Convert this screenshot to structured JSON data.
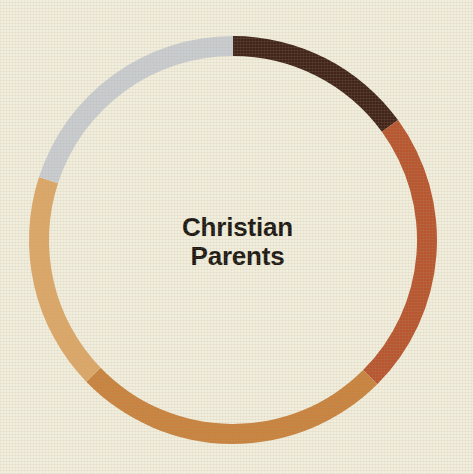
{
  "figure": {
    "background_color": "#f2eede",
    "texture": "woven-paper",
    "center_label_line1": "Christian",
    "center_label_line2": "Parents",
    "center_label_color": "#1b1713"
  },
  "chart_data": {
    "type": "pie",
    "variant": "donut",
    "title": "Christian Parents",
    "subtitle": "",
    "xlabel": "",
    "ylabel": "",
    "legend_position": "none",
    "grid": false,
    "units": "percent",
    "total": 100,
    "start_angle_deg": 0,
    "direction": "clockwise",
    "center_px": [
      233,
      240
    ],
    "outer_radius_px": 204,
    "inner_radius_px": 184,
    "labels": [
      "Segment 1",
      "Segment 2",
      "Segment 3",
      "Segment 4",
      "Segment 5"
    ],
    "values": [
      15.0,
      22.5,
      25.3,
      17.2,
      20.0
    ],
    "start_angles_deg": [
      0,
      54,
      135,
      226,
      288
    ],
    "end_angles_deg": [
      54,
      135,
      226,
      288,
      360
    ],
    "colors": [
      "#42251a",
      "#b85630",
      "#c9833f",
      "#dca768",
      "#c9cdd1"
    ],
    "slices": [
      {
        "label": "Segment 1",
        "value": 15.0,
        "color": "#42251a",
        "start_deg": 0,
        "end_deg": 54
      },
      {
        "label": "Segment 2",
        "value": 22.5,
        "color": "#b85630",
        "start_deg": 54,
        "end_deg": 135
      },
      {
        "label": "Segment 3",
        "value": 25.3,
        "color": "#c9833f",
        "start_deg": 135,
        "end_deg": 226
      },
      {
        "label": "Segment 4",
        "value": 17.2,
        "color": "#dca768",
        "start_deg": 226,
        "end_deg": 288
      },
      {
        "label": "Segment 5",
        "value": 20.0,
        "color": "#c9cdd1",
        "start_deg": 288,
        "end_deg": 360
      }
    ]
  }
}
